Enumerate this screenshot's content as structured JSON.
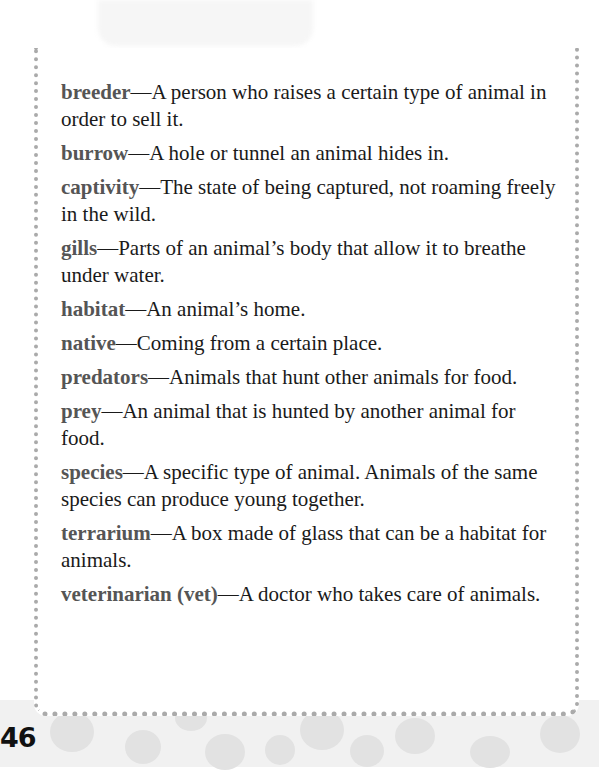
{
  "glossary": {
    "entries": [
      {
        "term": "breeder",
        "definition": "—A person who raises a certain type of animal in order to sell it."
      },
      {
        "term": "burrow",
        "definition": "—A hole or tunnel an animal hides in."
      },
      {
        "term": "captivity",
        "definition": "—The state of being captured, not roaming freely in the wild."
      },
      {
        "term": "gills",
        "definition": "—Parts of an animal’s body that allow it to breathe under water."
      },
      {
        "term": "habitat",
        "definition": "—An animal’s home."
      },
      {
        "term": "native",
        "definition": "—Coming from a certain place."
      },
      {
        "term": "predators",
        "definition": "—Animals that hunt other animals for food."
      },
      {
        "term": "prey",
        "definition": "—An animal that is hunted by another animal for food."
      },
      {
        "term": "species",
        "definition": "—A specific type of animal. Animals of the same species can produce young together."
      },
      {
        "term": "terrarium",
        "definition": "—A box made of glass that can be a habitat for animals."
      },
      {
        "term": "veterinarian (vet)",
        "definition": "—A doctor who takes care of animals."
      }
    ]
  },
  "footer": {
    "page_number": "46"
  },
  "colors": {
    "term": "#555555",
    "text": "#1a1a1a",
    "dots": "#aaaaaa",
    "footer_bg": "#f1f1f1"
  }
}
